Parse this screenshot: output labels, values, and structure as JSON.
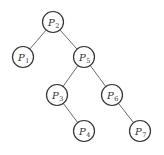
{
  "diagram": {
    "type": "binary-tree",
    "nodes": [
      {
        "id": "n2",
        "label": "P",
        "sub": "2",
        "x": 53,
        "y": 22
      },
      {
        "id": "n1",
        "label": "P",
        "sub": "1",
        "x": 23,
        "y": 57
      },
      {
        "id": "n5",
        "label": "P",
        "sub": "5",
        "x": 84,
        "y": 57
      },
      {
        "id": "n3",
        "label": "P",
        "sub": "3",
        "x": 57,
        "y": 95
      },
      {
        "id": "n6",
        "label": "P",
        "sub": "6",
        "x": 112,
        "y": 95
      },
      {
        "id": "n4",
        "label": "P",
        "sub": "4",
        "x": 84,
        "y": 131
      },
      {
        "id": "n7",
        "label": "P",
        "sub": "7",
        "x": 140,
        "y": 131
      }
    ],
    "edges": [
      [
        "n2",
        "n1"
      ],
      [
        "n2",
        "n5"
      ],
      [
        "n5",
        "n3"
      ],
      [
        "n5",
        "n6"
      ],
      [
        "n3",
        "n4"
      ],
      [
        "n6",
        "n7"
      ]
    ]
  }
}
